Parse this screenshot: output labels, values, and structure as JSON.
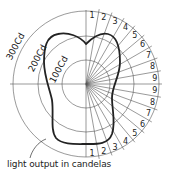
{
  "diagram": {
    "ring_labels": [
      "100Cd",
      "200Cd",
      "300Cd"
    ],
    "ring_values_cd": [
      100,
      200,
      300
    ],
    "upper_angle_labels": [
      "1",
      "2",
      "3",
      "4",
      "5",
      "6",
      "7",
      "8",
      "9"
    ],
    "lower_angle_labels": [
      "9",
      "8",
      "7",
      "6",
      "5",
      "4",
      "3",
      "2",
      "1"
    ],
    "caption": "light output in candelas",
    "colors": {
      "line": "#222222",
      "grid": "#555555",
      "background": "#ffffff"
    }
  }
}
